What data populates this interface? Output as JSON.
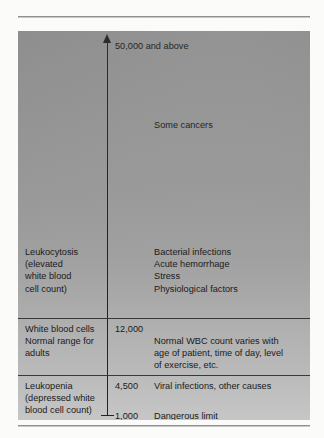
{
  "figure": {
    "axis": {
      "top_label": "50,000 and above",
      "arrow_icon": "up-arrow-icon",
      "foot_tick_icon": "axis-tick-icon"
    },
    "bands": [
      {
        "id": "high",
        "condition": "Leukocytosis\n(elevated\nwhite blood\ncell count)",
        "value": "",
        "notes": "Bacterial infections\nAcute hemorrhage\nStress\nPhysiological factors",
        "extra_note": "Some cancers"
      },
      {
        "id": "normal",
        "condition": "White blood cells\nNormal range for\nadults",
        "value": "12,000",
        "notes": "Normal WBC count varies with\nage of patient, time of day, level\nof exercise, etc."
      },
      {
        "id": "low",
        "condition": "Leukopenia\n(depressed white\nblood cell count)",
        "value": "4,500",
        "notes": "Viral infections, other causes",
        "limit_value": "1,000",
        "limit_note": "Dangerous limit"
      }
    ],
    "colors": {
      "panel_top": "#8e8e8e",
      "panel_bottom": "#cdcdcd",
      "axis": "#242424",
      "text": "#1b1b1b",
      "rule": "#8f8f8f"
    }
  }
}
